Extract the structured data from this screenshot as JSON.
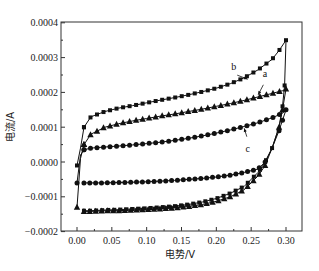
{
  "chart_data": {
    "type": "line",
    "title": "",
    "xlabel": "电势/V",
    "ylabel": "电流/A",
    "xlim": [
      -0.02,
      0.32
    ],
    "ylim": [
      -0.0002,
      0.0004
    ],
    "x_ticks": [
      "0.00",
      "0.05",
      "0.10",
      "0.15",
      "0.20",
      "0.25",
      "0.30"
    ],
    "y_ticks": [
      "-0.0002",
      "-0.0001",
      "0.0000",
      "0.0001",
      "0.0002",
      "0.0003",
      "0.0004"
    ],
    "grid": false,
    "legend": "inline annotations a, b, c with arrows",
    "series": [
      {
        "name": "a",
        "marker": "triangle",
        "forward": {
          "x": [
            0.0,
            0.005,
            0.01,
            0.02,
            0.04,
            0.06,
            0.08,
            0.1,
            0.12,
            0.14,
            0.16,
            0.18,
            0.2,
            0.22,
            0.24,
            0.26,
            0.28,
            0.295,
            0.3
          ],
          "y": [
            -0.00013,
            1e-05,
            5e-05,
            8e-05,
            0.0001,
            0.00011,
            0.000118,
            0.000125,
            0.000132,
            0.000138,
            0.000145,
            0.000152,
            0.00016,
            0.000168,
            0.000177,
            0.000187,
            0.000197,
            0.000205,
            0.00021
          ]
        },
        "reverse": {
          "x": [
            0.3,
            0.295,
            0.29,
            0.28,
            0.27,
            0.26,
            0.24,
            0.22,
            0.2,
            0.18,
            0.16,
            0.14,
            0.12,
            0.1,
            0.08,
            0.06,
            0.04,
            0.02,
            0.01
          ],
          "y": [
            0.00021,
            0.00015,
            0.0001,
            4e-05,
            -1e-05,
            -4e-05,
            -8e-05,
            -0.0001,
            -0.000113,
            -0.000122,
            -0.000128,
            -0.000132,
            -0.000135,
            -0.000137,
            -0.000138,
            -0.00014,
            -0.00014,
            -0.000142,
            -0.000142
          ]
        }
      },
      {
        "name": "b",
        "marker": "square",
        "forward": {
          "x": [
            0.0,
            0.005,
            0.01,
            0.02,
            0.04,
            0.06,
            0.08,
            0.1,
            0.12,
            0.14,
            0.16,
            0.18,
            0.2,
            0.22,
            0.24,
            0.26,
            0.28,
            0.29,
            0.3
          ],
          "y": [
            -1e-05,
            4e-05,
            0.0001,
            0.00013,
            0.000145,
            0.000155,
            0.000162,
            0.00017,
            0.000178,
            0.000185,
            0.000193,
            0.000202,
            0.000212,
            0.000225,
            0.000242,
            0.000265,
            0.000295,
            0.00032,
            0.00035
          ]
        },
        "reverse": {
          "x": [
            0.3,
            0.298,
            0.295,
            0.29,
            0.28,
            0.27,
            0.26,
            0.24,
            0.22,
            0.2,
            0.18,
            0.16,
            0.14,
            0.12,
            0.1,
            0.08,
            0.06,
            0.04,
            0.02,
            0.01
          ],
          "y": [
            0.00035,
            0.00022,
            0.00016,
            0.0001,
            4e-05,
            0.0,
            -3e-05,
            -7e-05,
            -9e-05,
            -0.000105,
            -0.000115,
            -0.000122,
            -0.000127,
            -0.00013,
            -0.000133,
            -0.000135,
            -0.000137,
            -0.000138,
            -0.00014,
            -0.00014
          ]
        }
      },
      {
        "name": "c",
        "marker": "circle",
        "forward": {
          "x": [
            0.0,
            0.005,
            0.01,
            0.02,
            0.04,
            0.06,
            0.08,
            0.1,
            0.12,
            0.14,
            0.16,
            0.18,
            0.2,
            0.22,
            0.24,
            0.26,
            0.28,
            0.295,
            0.3
          ],
          "y": [
            -6e-05,
            2e-05,
            3.5e-05,
            4e-05,
            4.3e-05,
            4.6e-05,
            4.9e-05,
            5.3e-05,
            5.7e-05,
            6.2e-05,
            6.8e-05,
            7.5e-05,
            8.3e-05,
            9.2e-05,
            0.000102,
            0.000113,
            0.000127,
            0.00014,
            0.00015
          ]
        },
        "reverse": {
          "x": [
            0.3,
            0.295,
            0.29,
            0.28,
            0.27,
            0.26,
            0.24,
            0.22,
            0.2,
            0.18,
            0.16,
            0.14,
            0.12,
            0.1,
            0.08,
            0.06,
            0.04,
            0.02,
            0.01
          ],
          "y": [
            0.00015,
            0.00012,
            9e-05,
            4e-05,
            0.0,
            -2e-05,
            -3e-05,
            -3.8e-05,
            -4.3e-05,
            -4.7e-05,
            -5e-05,
            -5.3e-05,
            -5.5e-05,
            -5.7e-05,
            -5.8e-05,
            -5.9e-05,
            -6e-05,
            -6e-05,
            -6e-05
          ]
        }
      }
    ],
    "annotations": [
      {
        "label": "b",
        "text_x": 0.225,
        "text_y": 0.000265,
        "arrow_to_x": 0.245,
        "arrow_to_y": 0.000238
      },
      {
        "label": "a",
        "text_x": 0.27,
        "text_y": 0.000243,
        "arrow_to_x": 0.26,
        "arrow_to_y": 0.000193
      },
      {
        "label": "c",
        "text_x": 0.245,
        "text_y": 3e-05,
        "arrow_to_x": 0.24,
        "arrow_to_y": 9.7e-05
      }
    ]
  }
}
